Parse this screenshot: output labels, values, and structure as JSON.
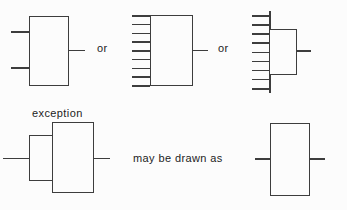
{
  "labels": {
    "or_1": "or",
    "or_2": "or",
    "exception": "exception",
    "may_be_drawn_as": "may be drawn as"
  },
  "symbols": {
    "two_input_block": {
      "inputs": 2,
      "outputs": 1
    },
    "multi_input_block": {
      "inputs": 9,
      "outputs": 1
    },
    "common_line_block": {
      "inputs": 9,
      "outputs": 1
    },
    "overlapping_blocks": {
      "inputs": 1,
      "outputs": 1
    },
    "simple_block": {
      "inputs": 1,
      "outputs": 1
    }
  },
  "colors": {
    "line": "#3d3d3d",
    "text": "#1c1c1c",
    "background": "#fcfcfc"
  }
}
